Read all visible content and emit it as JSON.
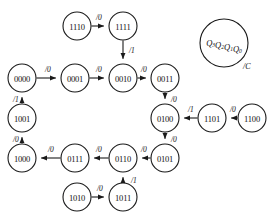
{
  "diagram": {
    "kind": "state-transition-diagram",
    "title": "",
    "canvas": {
      "width": 275,
      "height": 220
    },
    "style": {
      "background": "#ffffff",
      "stroke": "#1a1a1a",
      "text": "#111111",
      "node_radius": 14,
      "legend_radius": 24
    },
    "nodes": [
      {
        "id": "n1110",
        "label": "1110",
        "cx": 77,
        "cy": 26,
        "r": 14
      },
      {
        "id": "n1111",
        "label": "1111",
        "cx": 123,
        "cy": 26,
        "r": 14
      },
      {
        "id": "n0000",
        "label": "0000",
        "cx": 22,
        "cy": 78,
        "r": 14
      },
      {
        "id": "n0001",
        "label": "0001",
        "cx": 75,
        "cy": 78,
        "r": 14
      },
      {
        "id": "n0010",
        "label": "0010",
        "cx": 123,
        "cy": 78,
        "r": 14
      },
      {
        "id": "n0011",
        "label": "0011",
        "cx": 165,
        "cy": 78,
        "r": 14
      },
      {
        "id": "n1001",
        "label": "1001",
        "cx": 22,
        "cy": 118,
        "r": 14
      },
      {
        "id": "n0100",
        "label": "0100",
        "cx": 165,
        "cy": 118,
        "r": 14
      },
      {
        "id": "n1101",
        "label": "1101",
        "cx": 212,
        "cy": 118,
        "r": 14
      },
      {
        "id": "n1100",
        "label": "1100",
        "cx": 252,
        "cy": 118,
        "r": 14
      },
      {
        "id": "n1000",
        "label": "1000",
        "cx": 22,
        "cy": 158,
        "r": 14
      },
      {
        "id": "n0111",
        "label": "0111",
        "cx": 75,
        "cy": 158,
        "r": 14
      },
      {
        "id": "n0110",
        "label": "0110",
        "cx": 123,
        "cy": 158,
        "r": 14
      },
      {
        "id": "n0101",
        "label": "0101",
        "cx": 165,
        "cy": 158,
        "r": 14
      },
      {
        "id": "n1010",
        "label": "1010",
        "cx": 77,
        "cy": 197,
        "r": 14
      },
      {
        "id": "n1011",
        "label": "1011",
        "cx": 123,
        "cy": 197,
        "r": 14
      }
    ],
    "edges": [
      {
        "id": "e1",
        "from": "n1110",
        "to": "n1111",
        "label": "/0",
        "label_x": 96,
        "label_y": 17
      },
      {
        "id": "e2",
        "from": "n1111",
        "to": "n0010",
        "label": "/1",
        "label_x": 129,
        "label_y": 50
      },
      {
        "id": "e3",
        "from": "n0000",
        "to": "n0001",
        "label": "/0",
        "label_x": 45,
        "label_y": 69
      },
      {
        "id": "e4",
        "from": "n0001",
        "to": "n0010",
        "label": "/0",
        "label_x": 96,
        "label_y": 69
      },
      {
        "id": "e5",
        "from": "n0010",
        "to": "n0011",
        "label": "/0",
        "label_x": 141,
        "label_y": 69
      },
      {
        "id": "e6",
        "from": "n0011",
        "to": "n0100",
        "label": "/0",
        "label_x": 171,
        "label_y": 99
      },
      {
        "id": "e7",
        "from": "n0100",
        "to": "n0101",
        "label": "/0",
        "label_x": 171,
        "label_y": 139
      },
      {
        "id": "e8",
        "from": "n1100",
        "to": "n1101",
        "label": "/0",
        "label_x": 230,
        "label_y": 109
      },
      {
        "id": "e9",
        "from": "n1101",
        "to": "n0100",
        "label": "/1",
        "label_x": 188,
        "label_y": 109
      },
      {
        "id": "e10",
        "from": "n0101",
        "to": "n0110",
        "label": "/0",
        "label_x": 141,
        "label_y": 149
      },
      {
        "id": "e11",
        "from": "n0110",
        "to": "n0111",
        "label": "/0",
        "label_x": 96,
        "label_y": 149
      },
      {
        "id": "e12",
        "from": "n0111",
        "to": "n1000",
        "label": "/0",
        "label_x": 48,
        "label_y": 149
      },
      {
        "id": "e13",
        "from": "n1000",
        "to": "n1001",
        "label": "/0",
        "label_x": 13,
        "label_y": 139
      },
      {
        "id": "e14",
        "from": "n1001",
        "to": "n0000",
        "label": "/1",
        "label_x": 13,
        "label_y": 99
      },
      {
        "id": "e15",
        "from": "n1010",
        "to": "n1011",
        "label": "/0",
        "label_x": 97,
        "label_y": 188
      },
      {
        "id": "e16",
        "from": "n1011",
        "to": "n0110",
        "label": "/1",
        "label_x": 131,
        "label_y": 180
      }
    ],
    "legend": {
      "cx": 224,
      "cy": 43,
      "r": 24,
      "state_label": "Q3Q2Q1Q0",
      "state_parts": [
        {
          "base": "Q",
          "sub": "3"
        },
        {
          "base": "Q",
          "sub": "2"
        },
        {
          "base": "Q",
          "sub": "1"
        },
        {
          "base": "Q",
          "sub": "0"
        }
      ],
      "output_label": "/C",
      "output_x": 243,
      "output_y": 66
    }
  }
}
